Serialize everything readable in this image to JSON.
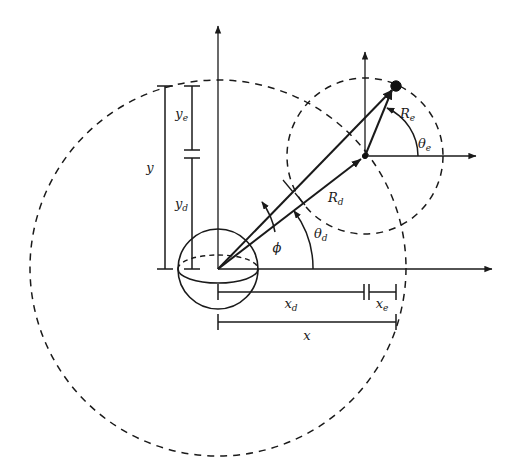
{
  "figure": {
    "title": "",
    "background_color": "#ffffff",
    "stroke_color": "#1a1a1a",
    "width": 515,
    "height": 475
  },
  "labels": {
    "y": "y",
    "y_e": "y",
    "y_e_sub": "e",
    "y_d": "y",
    "y_d_sub": "d",
    "x": "x",
    "x_d": "x",
    "x_d_sub": "d",
    "x_e": "x",
    "x_e_sub": "e",
    "R_e": "R",
    "R_e_sub": "e",
    "R_d": "R",
    "R_d_sub": "d",
    "theta_e": "θ",
    "theta_e_sub": "e",
    "theta_d": "θ",
    "theta_d_sub": "d",
    "phi": "ϕ"
  },
  "geometry": {
    "origin_primary": {
      "x": 218,
      "y": 269
    },
    "origin_secondary": {
      "x": 365,
      "y": 156
    },
    "target_point": {
      "x": 396,
      "y": 86
    },
    "sphere": {
      "cx": 218,
      "cy": 269,
      "r": 40
    },
    "circle_large": {
      "cx": 218,
      "cy": 268,
      "r": 188
    },
    "circle_medium": {
      "cx": 365,
      "cy": 156,
      "r": 78
    },
    "axis_primary_vertical": {
      "x": 218,
      "y_top": 22,
      "y_bottom": 269
    },
    "axis_primary_horizontal": {
      "y": 269,
      "x_left": 218,
      "x_right": 496
    },
    "axis_secondary_vertical": {
      "x": 365,
      "y_top": 48,
      "y_bottom": 156
    },
    "axis_secondary_horizontal": {
      "y": 156,
      "x_left": 365,
      "x_right": 480
    }
  },
  "dimensions": {
    "y_bar": {
      "x": 165,
      "y_top": 86,
      "y_bottom": 269
    },
    "y_e_bar": {
      "x": 192,
      "y_top": 86,
      "y_bottom": 150
    },
    "y_d_bar": {
      "x": 192,
      "y_top": 158,
      "y_bottom": 269
    },
    "x_d_bar": {
      "y": 292,
      "x_left": 218,
      "x_right": 364
    },
    "x_e_bar": {
      "y": 292,
      "x_left": 369,
      "x_right": 396
    },
    "x_bar": {
      "y": 322,
      "x_left": 218,
      "x_right": 396
    }
  },
  "angles": {
    "phi_deg": 37.5,
    "theta_d_deg": 37.5,
    "theta_e_deg": 66.1
  },
  "vectors": [
    {
      "name": "R_d",
      "from": "origin_primary",
      "to": "origin_secondary"
    },
    {
      "name": "R_total",
      "from": "origin_primary",
      "to": "target_point"
    },
    {
      "name": "R_e",
      "from": "origin_secondary",
      "to": "target_point"
    }
  ]
}
